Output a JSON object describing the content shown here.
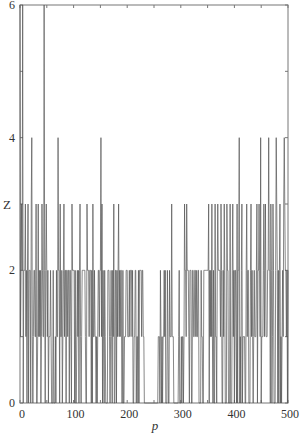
{
  "chart_data": {
    "type": "line",
    "title": "",
    "xlabel": "p",
    "ylabel": "Z",
    "xlim": [
      0,
      500
    ],
    "ylim": [
      0,
      6
    ],
    "xticks": [
      0,
      100,
      200,
      300,
      400,
      500
    ],
    "xtick_labels": [
      "0",
      "100",
      "200",
      "300",
      "400",
      "500"
    ],
    "yticks": [
      0,
      2,
      4,
      6
    ],
    "ytick_labels": [
      "0",
      "2",
      "4",
      "6"
    ],
    "minor_yticks": [
      1,
      3,
      5
    ],
    "top_minor_xticks_step": 50,
    "grid": false,
    "legend": null,
    "line_color": "#555555",
    "value_levels": [
      0,
      1,
      2,
      3,
      4,
      6
    ],
    "spikes_to_6_at_p": [
      0,
      5,
      45
    ],
    "spikes_to_4_at_p": [
      22,
      71,
      151,
      409,
      449,
      464,
      478,
      493
    ],
    "spikes_to_3_at_p": [
      0,
      3,
      10,
      15,
      21,
      30,
      34,
      41,
      45,
      49,
      75,
      82,
      97,
      112,
      125,
      136,
      153,
      175,
      184,
      283,
      307,
      311,
      352,
      358,
      364,
      369,
      375,
      381,
      386,
      392,
      397,
      405,
      414,
      423,
      431,
      442,
      446,
      449,
      455,
      458,
      464,
      468,
      472,
      479,
      485,
      492,
      494
    ],
    "gap_p_range": [
      232,
      258
    ],
    "sparse_p_range": [
      258,
      307
    ],
    "dense_level2_ranges": [
      [
        0,
        230
      ],
      [
        258,
        275
      ],
      [
        300,
        500
      ]
    ],
    "series": [
      {
        "name": "Z",
        "x_range": [
          0,
          500
        ],
        "step": 1
      }
    ]
  },
  "axes": {
    "x_label": "p",
    "y_label": "Z"
  }
}
